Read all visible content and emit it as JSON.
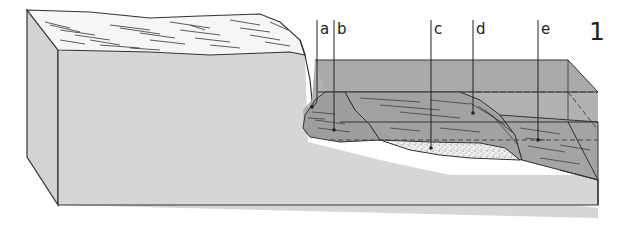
{
  "figure": {
    "number": "1"
  },
  "labels": [
    {
      "letter": "a",
      "x": 318,
      "label_y": 28,
      "point_y": 106
    },
    {
      "letter": "b",
      "x": 334,
      "label_y": 28,
      "point_y": 130
    },
    {
      "letter": "c",
      "x": 431,
      "label_y": 28,
      "point_y": 148
    },
    {
      "letter": "d",
      "x": 473,
      "label_y": 28,
      "point_y": 113
    },
    {
      "letter": "e",
      "x": 538,
      "label_y": 28,
      "point_y": 140
    }
  ],
  "colors": {
    "block_face": "#d6d6d6",
    "block_side": "#d2d2d2",
    "water": "#a9a9a9",
    "water_top": "#b0b0b0",
    "sediment": "#9c9c9c",
    "sand": "#ececec",
    "outline": "#333333",
    "land_surface": "#f7f7f7"
  }
}
